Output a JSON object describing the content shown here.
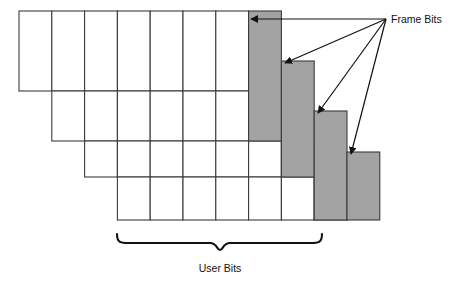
{
  "figure": {
    "background_color": "#ffffff",
    "line_color": "#3b3b3b",
    "gray_fill": "#a3a3a3",
    "white_fill": "#ffffff",
    "arrow_color": "#111111"
  },
  "labels": {
    "frame_bits": "Frame Bits",
    "user_bits": "User Bits"
  },
  "geometry": {
    "cell_width": 32.8,
    "row_height": 50,
    "row_stagger_x": 32.8,
    "origin_x": 19,
    "origin_y": 11
  },
  "chart_data": {
    "type": "diagram",
    "rows": [
      {
        "index": 1,
        "x": 19,
        "y": 11,
        "white_cells": 7,
        "gray_cells": 1,
        "gray_x": 248.6,
        "gray_y": 11,
        "gray_width": 32.8,
        "gray_height": 130,
        "row_height": 80
      },
      {
        "index": 2,
        "x": 51.8,
        "y": 91,
        "white_cells": 7,
        "gray_cells": 1,
        "gray_x": 281.4,
        "gray_y": 61,
        "gray_width": 32.8,
        "gray_height": 116,
        "row_height": 50
      },
      {
        "index": 3,
        "x": 84.6,
        "y": 141,
        "white_cells": 7,
        "gray_cells": 1,
        "gray_x": 314.2,
        "gray_y": 111,
        "gray_width": 32.8,
        "gray_height": 109,
        "row_height": 36
      },
      {
        "index": 4,
        "x": 117.4,
        "y": 177,
        "white_cells": 7,
        "gray_cells": 1,
        "gray_x": 347,
        "gray_y": 152,
        "gray_width": 32.8,
        "gray_height": 68,
        "row_height": 43
      }
    ],
    "arrows": {
      "origin": {
        "x": 386,
        "y": 19
      },
      "targets": [
        {
          "x": 251,
          "y": 19
        },
        {
          "x": 285,
          "y": 63
        },
        {
          "x": 318,
          "y": 113
        },
        {
          "x": 351,
          "y": 154
        }
      ],
      "label": "Frame Bits"
    },
    "brace": {
      "left_x": 117,
      "right_x": 322,
      "y": 243,
      "center_x": 220,
      "label": "User Bits",
      "label_y": 270
    }
  }
}
